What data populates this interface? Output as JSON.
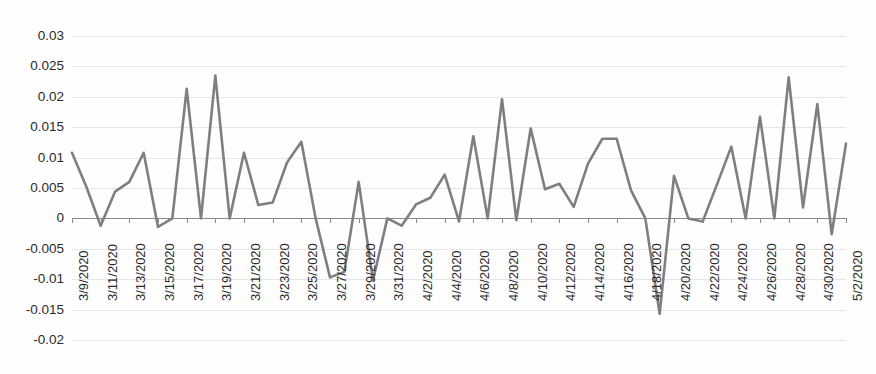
{
  "chart_data": {
    "type": "line",
    "title": "",
    "subtitle": "",
    "xlabel": "",
    "ylabel": "",
    "grid": true,
    "legend": false,
    "legend_position": "none",
    "series_color": "#7f7f7f",
    "gridline_color": "#e4e6ea",
    "axis_color": "#8a8a8a",
    "background_color": "#fefefe",
    "ylim": [
      -0.02,
      0.03
    ],
    "ytick_labels": [
      "0.03",
      "0.025",
      "0.02",
      "0.015",
      "0.01",
      "0.005",
      "0",
      "-0.005",
      "-0.01",
      "-0.015",
      "-0.02"
    ],
    "ytick_values": [
      0.03,
      0.025,
      0.02,
      0.015,
      0.01,
      0.005,
      0,
      -0.005,
      -0.01,
      -0.015,
      -0.02
    ],
    "xtick_labels": [
      "3/9/2020",
      "3/11/2020",
      "3/13/2020",
      "3/15/2020",
      "3/17/2020",
      "3/19/2020",
      "3/21/2020",
      "3/23/2020",
      "3/25/2020",
      "3/27/2020",
      "3/29/2020",
      "3/31/2020",
      "4/2/2020",
      "4/4/2020",
      "4/6/2020",
      "4/8/2020",
      "4/10/2020",
      "4/12/2020",
      "4/14/2020",
      "4/16/2020",
      "4/18/2020",
      "4/20/2020",
      "4/22/2020",
      "4/24/2020",
      "4/26/2020",
      "4/28/2020",
      "4/30/2020",
      "5/2/2020"
    ],
    "xtick_interval_days": 2,
    "x": [
      "3/9/2020",
      "3/10/2020",
      "3/11/2020",
      "3/12/2020",
      "3/13/2020",
      "3/14/2020",
      "3/15/2020",
      "3/16/2020",
      "3/17/2020",
      "3/18/2020",
      "3/19/2020",
      "3/20/2020",
      "3/21/2020",
      "3/22/2020",
      "3/23/2020",
      "3/24/2020",
      "3/25/2020",
      "3/26/2020",
      "3/27/2020",
      "3/28/2020",
      "3/29/2020",
      "3/30/2020",
      "3/31/2020",
      "4/1/2020",
      "4/2/2020",
      "4/3/2020",
      "4/4/2020",
      "4/5/2020",
      "4/6/2020",
      "4/7/2020",
      "4/8/2020",
      "4/9/2020",
      "4/10/2020",
      "4/11/2020",
      "4/12/2020",
      "4/13/2020",
      "4/14/2020",
      "4/15/2020",
      "4/16/2020",
      "4/17/2020",
      "4/18/2020",
      "4/19/2020",
      "4/20/2020",
      "4/21/2020",
      "4/22/2020",
      "4/23/2020",
      "4/24/2020",
      "4/25/2020",
      "4/26/2020",
      "4/27/2020",
      "4/28/2020",
      "4/29/2020",
      "4/30/2020",
      "5/1/2020",
      "5/2/2020"
    ],
    "values": [
      0.0108,
      0.0052,
      -0.0012,
      0.0044,
      0.006,
      0.0108,
      -0.0014,
      0.0,
      0.0213,
      0.0,
      0.0235,
      0.0,
      0.0108,
      0.0022,
      0.0026,
      0.0092,
      0.0126,
      0.0,
      -0.0097,
      -0.0088,
      0.006,
      -0.0102,
      0.0,
      -0.0012,
      0.0023,
      0.0034,
      0.0072,
      -0.0005,
      0.0135,
      0.0,
      0.0196,
      -0.0003,
      0.0148,
      0.0048,
      0.0057,
      0.0019,
      0.009,
      0.0131,
      0.0131,
      0.0046,
      0.0,
      -0.0157,
      0.007,
      0.0,
      -0.0005,
      0.0056,
      0.0118,
      0.0,
      0.0167,
      0.0,
      0.0232,
      0.0018,
      0.0188,
      -0.0026,
      0.0123
    ]
  }
}
